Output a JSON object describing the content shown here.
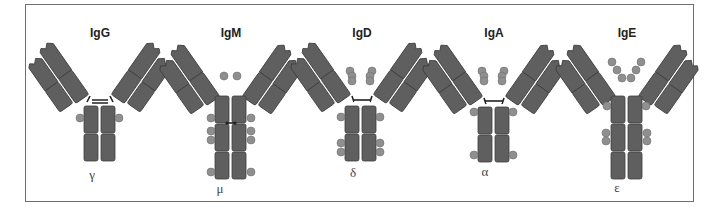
{
  "figure": {
    "colors": {
      "domain_fill": "#5f5f5f",
      "domain_stroke": "#3c3c3c",
      "carbohydrate_bead": "#8f8f8f",
      "frame": "#6e6e6e",
      "background": "#ffffff"
    },
    "antibodies": [
      {
        "name": "IgG",
        "heavy_chain": "γ",
        "cx": 100,
        "fc_domains": 2,
        "hinge": "disulfide-ladder"
      },
      {
        "name": "IgM",
        "heavy_chain": "μ",
        "cx": 231,
        "fc_domains": 3,
        "hinge": "none"
      },
      {
        "name": "IgD",
        "heavy_chain": "δ",
        "cx": 362,
        "fc_domains": 2,
        "hinge": "disulfide-ladder"
      },
      {
        "name": "IgA",
        "heavy_chain": "α",
        "cx": 494,
        "fc_domains": 2,
        "hinge": "disulfide-ladder"
      },
      {
        "name": "IgE",
        "heavy_chain": "ε",
        "cx": 625,
        "fc_domains": 3,
        "hinge": "none"
      }
    ]
  }
}
